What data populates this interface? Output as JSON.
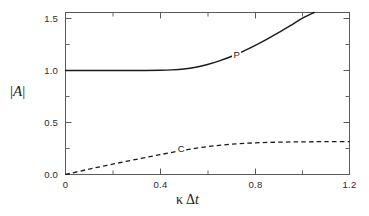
{
  "figure": {
    "background_color": "#ffffff",
    "line_color": "#1a1a1a",
    "axis_color": "#4a4a4a"
  },
  "axes": {
    "y_label": "|A|",
    "y_label_bar": "|",
    "y_label_letter": "A",
    "x_label": "κ Δt",
    "x_label_kappa": "κ",
    "x_label_delta": "Δ",
    "x_label_t": "t"
  },
  "chart_data": {
    "type": "line",
    "title": "",
    "xlabel": "κ Δt",
    "ylabel": "|A|",
    "xlim": [
      0,
      1.2
    ],
    "ylim": [
      0,
      1.558
    ],
    "grid": false,
    "legend": "inline-curve-labels",
    "x_ticks": [
      0,
      0.4,
      0.8,
      1.2
    ],
    "x_tick_labels": [
      "0",
      "0.4",
      "0.8",
      "1.2"
    ],
    "x_minor_ticks": [
      0.2,
      0.6,
      1.0
    ],
    "y_ticks": [
      0.0,
      0.5,
      1.0,
      1.5
    ],
    "y_tick_labels": [
      "0.0",
      "0.5",
      "1.0",
      "1.5"
    ],
    "y_minor_ticks": [
      0.25,
      0.75,
      1.25
    ],
    "series": [
      {
        "name": "P",
        "label": "P",
        "style": "solid",
        "label_x": 0.72,
        "label_y": 1.14,
        "x": [
          0.0,
          0.1,
          0.2,
          0.3,
          0.4,
          0.45,
          0.5,
          0.55,
          0.6,
          0.65,
          0.7,
          0.75,
          0.8,
          0.85,
          0.9,
          0.95,
          1.0,
          1.05
        ],
        "y": [
          1.0,
          1.0,
          1.0,
          1.0,
          1.002,
          1.006,
          1.015,
          1.032,
          1.058,
          1.093,
          1.135,
          1.185,
          1.24,
          1.3,
          1.364,
          1.432,
          1.502,
          1.558
        ]
      },
      {
        "name": "C",
        "label": "C",
        "style": "dashed",
        "label_x": 0.485,
        "label_y": 0.233,
        "x": [
          0.0,
          0.1,
          0.2,
          0.3,
          0.4,
          0.5,
          0.6,
          0.7,
          0.8,
          0.9,
          1.0,
          1.1,
          1.2
        ],
        "y": [
          0.0,
          0.052,
          0.1,
          0.146,
          0.191,
          0.234,
          0.268,
          0.291,
          0.304,
          0.311,
          0.314,
          0.316,
          0.316
        ]
      }
    ]
  },
  "tick_text": {
    "y": [
      "1.5",
      "1.0",
      "0.5",
      "0.0"
    ],
    "x": [
      "0",
      "0.4",
      "0.8",
      "1.2"
    ]
  }
}
